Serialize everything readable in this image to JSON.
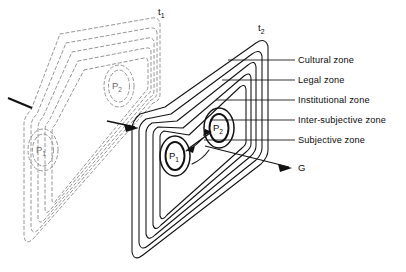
{
  "figure": {
    "type": "diagram",
    "planes": [
      {
        "id": "t1",
        "label": "t",
        "subscript": "1",
        "style": "dashed",
        "label_x": 158,
        "label_y": 8
      },
      {
        "id": "t2",
        "label": "t",
        "subscript": "2",
        "style": "solid",
        "label_x": 258,
        "label_y": 24
      }
    ],
    "zones": [
      {
        "index": 1,
        "name": "Cultural zone",
        "label_x": 298,
        "label_y": 55
      },
      {
        "index": 2,
        "name": "Legal zone",
        "label_x": 298,
        "label_y": 75
      },
      {
        "index": 3,
        "name": "Institutional zone",
        "label_x": 298,
        "label_y": 95
      },
      {
        "index": 4,
        "name": "Inter-subjective zone",
        "label_x": 298,
        "label_y": 115
      },
      {
        "index": 5,
        "name": "Subjective zone",
        "label_x": 298,
        "label_y": 135
      }
    ],
    "nodes": [
      {
        "id": "p1-t1",
        "label": "P",
        "subscript": "1",
        "plane": "t1",
        "x": 41,
        "y": 151,
        "ghost": true
      },
      {
        "id": "p2-t1",
        "label": "P",
        "subscript": "2",
        "plane": "t1",
        "x": 117,
        "y": 88,
        "ghost": true
      },
      {
        "id": "p1-t2",
        "label": "P",
        "subscript": "1",
        "plane": "t2",
        "x": 174,
        "y": 157,
        "ghost": false
      },
      {
        "id": "p2-t2",
        "label": "P",
        "subscript": "2",
        "plane": "t2",
        "x": 218,
        "y": 130,
        "ghost": false
      }
    ],
    "annotations": [
      {
        "id": "g-label",
        "text": "G",
        "x": 300,
        "y": 164
      }
    ]
  },
  "colors": {
    "solid_stroke": "#111111",
    "dashed_stroke": "#8a8a8a",
    "text": "#0a0a0a",
    "ghost_text": "#6c6c6c",
    "background": "#ffffff"
  }
}
